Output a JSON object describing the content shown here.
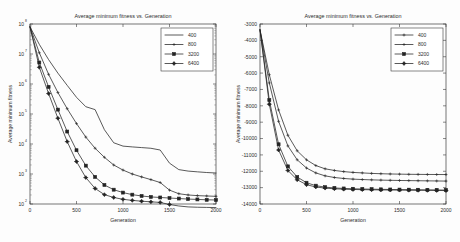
{
  "figure": {
    "background_color": "#fdfdfd",
    "line_color": "#232323",
    "axis_color": "#3a3a3a",
    "panel_count": 2
  },
  "chart_data": [
    {
      "id": "left",
      "type": "line",
      "title": "Average minimum fitness vs. Generation",
      "xlabel": "Generation",
      "ylabel": "Average minimum fitness",
      "xscale": "linear",
      "yscale": "log",
      "xlim": [
        0,
        2000
      ],
      "ylim": [
        100,
        100000000
      ],
      "xticks": [
        0,
        500,
        1000,
        1500,
        2000
      ],
      "xticklabels": [
        "0",
        "500",
        "1000",
        "1500",
        "2000"
      ],
      "yticks": [
        100,
        1000,
        10000,
        100000,
        1000000,
        10000000,
        100000000
      ],
      "yticklabels": [
        "10",
        "10",
        "10",
        "10",
        "10",
        "10",
        "10"
      ],
      "ytickexponents": [
        "2",
        "3",
        "4",
        "5",
        "6",
        "7",
        "8"
      ],
      "grid": false,
      "legend_position": "upper right",
      "x": [
        0,
        100,
        200,
        300,
        400,
        500,
        600,
        700,
        800,
        900,
        1000,
        1100,
        1200,
        1300,
        1400,
        1500,
        1600,
        1700,
        1800,
        1900,
        2000
      ],
      "series": [
        {
          "name": "400",
          "marker": "none",
          "values": [
            80000000,
            21000000,
            6500000,
            2300000,
            900000,
            360000,
            175000,
            140000,
            30000,
            11000,
            8500,
            8000,
            7600,
            7200,
            6300,
            2300,
            1400,
            1250,
            1180,
            1120,
            1080
          ]
        },
        {
          "name": "800",
          "marker": "plus",
          "values": [
            80000000,
            11000000,
            2100000,
            520000,
            150000,
            48000,
            17000,
            7200,
            3600,
            2000,
            1350,
            1000,
            800,
            650,
            520,
            290,
            220,
            200,
            190,
            185,
            180
          ]
        },
        {
          "name": "3200",
          "marker": "square",
          "values": [
            80000000,
            5200000,
            800000,
            140000,
            26000,
            6200,
            1900,
            800,
            430,
            300,
            240,
            205,
            185,
            172,
            165,
            158,
            152,
            146,
            142,
            138,
            136
          ]
        },
        {
          "name": "6400",
          "marker": "diamond",
          "values": [
            80000000,
            3600000,
            480000,
            72000,
            12000,
            2600,
            760,
            330,
            205,
            165,
            143,
            132,
            124,
            118,
            113,
            96,
            86,
            80,
            78,
            77,
            76
          ]
        }
      ]
    },
    {
      "id": "right",
      "type": "line",
      "title": "Average minimum fitness vs. Generation",
      "xlabel": "Generation",
      "ylabel": "Average minimum fitness",
      "xscale": "linear",
      "yscale": "linear",
      "xlim": [
        0,
        2000
      ],
      "ylim": [
        -14000,
        -3000
      ],
      "xticks": [
        0,
        500,
        1000,
        1500,
        2000
      ],
      "xticklabels": [
        "0",
        "500",
        "1000",
        "1500",
        "2000"
      ],
      "yticks": [
        -14000,
        -13000,
        -12000,
        -11000,
        -10000,
        -9000,
        -8000,
        -7000,
        -6000,
        -5000,
        -4000,
        -3000
      ],
      "yticklabels": [
        "-14000",
        "-13000",
        "-12000",
        "-11000",
        "-10000",
        "-9000",
        "-8000",
        "-7000",
        "-6000",
        "-5000",
        "-4000",
        "-3000"
      ],
      "grid": false,
      "legend_position": "upper right",
      "x": [
        0,
        100,
        200,
        300,
        400,
        500,
        600,
        700,
        800,
        900,
        1000,
        1100,
        1200,
        1300,
        1400,
        1500,
        1600,
        1700,
        1800,
        1900,
        2000
      ],
      "series": [
        {
          "name": "400",
          "marker": "plus",
          "values": [
            -3350,
            -6100,
            -8250,
            -9800,
            -10750,
            -11300,
            -11650,
            -11850,
            -11950,
            -12020,
            -12070,
            -12100,
            -12130,
            -12150,
            -12165,
            -12175,
            -12185,
            -12190,
            -12195,
            -12198,
            -12200
          ]
        },
        {
          "name": "800",
          "marker": "plus",
          "values": [
            -3350,
            -6600,
            -8950,
            -10450,
            -11300,
            -11800,
            -12100,
            -12280,
            -12380,
            -12440,
            -12480,
            -12505,
            -12525,
            -12540,
            -12552,
            -12562,
            -12570,
            -12578,
            -12585,
            -12592,
            -12600
          ]
        },
        {
          "name": "3200",
          "marker": "square",
          "values": [
            -3350,
            -7650,
            -10350,
            -11700,
            -12350,
            -12700,
            -12880,
            -12970,
            -13020,
            -13050,
            -13070,
            -13085,
            -13095,
            -13105,
            -13112,
            -13118,
            -13124,
            -13130,
            -13136,
            -13142,
            -13150
          ]
        },
        {
          "name": "6400",
          "marker": "diamond",
          "values": [
            -3350,
            -7900,
            -10700,
            -11950,
            -12520,
            -12820,
            -12960,
            -13030,
            -13070,
            -13095,
            -13112,
            -13124,
            -13133,
            -13140,
            -13146,
            -13152,
            -13157,
            -13162,
            -13167,
            -13172,
            -13180
          ]
        }
      ]
    }
  ]
}
